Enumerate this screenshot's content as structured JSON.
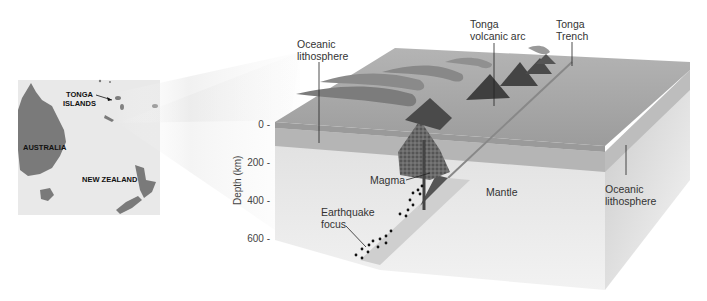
{
  "figure": {
    "palette": {
      "background": "#ffffff",
      "map_land": "#7a7a7a",
      "map_sea": "#e9e9e9",
      "ocean_surface": "#a4a4a4",
      "lithosphere_front": "#b8b8b8",
      "mantle_front": "#e2e2e2",
      "side_face": "#cfcfcf",
      "volcano": "#4a4a4a",
      "ash_plume": "#8a8a8a",
      "magma": "#5a5a5a",
      "quake_dot": "#111111"
    }
  },
  "map": {
    "labels": {
      "tonga_islands": [
        "TONGA",
        "ISLANDS"
      ],
      "australia": "AUSTRALIA",
      "new_zealand": "NEW ZEALAND"
    }
  },
  "diagram": {
    "labels": {
      "oceanic_lithosphere_left": [
        "Oceanic",
        "lithosphere"
      ],
      "tonga_volcanic_arc": [
        "Tonga",
        "volcanic arc"
      ],
      "tonga_trench": [
        "Tonga",
        "Trench"
      ],
      "magma": "Magma",
      "mantle": "Mantle",
      "oceanic_lithosphere_right": [
        "Oceanic",
        "lithosphere"
      ],
      "earthquake_focus": [
        "Earthquake",
        "focus"
      ]
    },
    "depth_axis": {
      "title": "Depth (km)",
      "ticks": [
        "0 -",
        "200 -",
        "400 -",
        "600 -"
      ]
    }
  }
}
